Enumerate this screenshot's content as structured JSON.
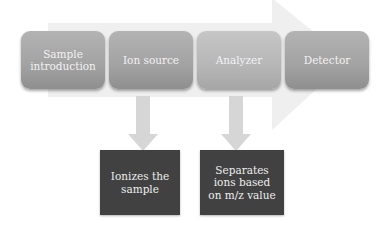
{
  "diagram": {
    "stages": [
      {
        "label": "Sample introduction"
      },
      {
        "label": "Ion source"
      },
      {
        "label": "Analyzer"
      },
      {
        "label": "Detector"
      }
    ],
    "descriptions": [
      {
        "stage": "Ion source",
        "label": "Ionizes the sample"
      },
      {
        "stage": "Analyzer",
        "label": "Separates ions based on m/z value"
      }
    ],
    "colors": {
      "stage_box": "#a8a8a8",
      "description_box": "#414141",
      "flow_arrow": "#ececec",
      "down_arrow": "#d6d6d6"
    }
  }
}
